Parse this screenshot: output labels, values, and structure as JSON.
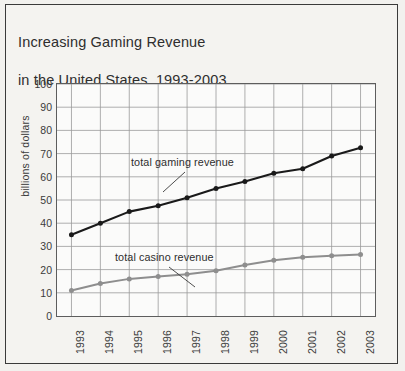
{
  "figure": {
    "title_line1": "Increasing Gaming Revenue",
    "title_line2": "in the United States, 1993-2003",
    "background_color": "#f2f1ee",
    "frame_color": "#3a3a3a"
  },
  "chart_data": {
    "type": "line",
    "title": "Increasing Gaming Revenue in the United States, 1993-2003",
    "xlabel": "",
    "ylabel": "billions of dollars",
    "categories": [
      "1993",
      "1994",
      "1995",
      "1996",
      "1997",
      "1998",
      "1999",
      "2000",
      "2001",
      "2002",
      "2003"
    ],
    "ylim": [
      0,
      100
    ],
    "ytick_labels": [
      "0",
      "10",
      "20",
      "30",
      "40",
      "50",
      "60",
      "70",
      "80",
      "90",
      "100"
    ],
    "ytick_values": [
      0,
      10,
      20,
      30,
      40,
      50,
      60,
      70,
      80,
      90,
      100
    ],
    "ytick_step": 10,
    "grid": true,
    "legend_position": "inline-annotation",
    "series": [
      {
        "name": "total gaming revenue",
        "color": "#1a1a1a",
        "marker": "circle",
        "values": [
          35,
          40,
          45,
          47.5,
          51,
          55,
          58,
          61.5,
          63.5,
          69,
          72.5
        ]
      },
      {
        "name": "total casino revenue",
        "color": "#8e8e8e",
        "marker": "circle",
        "values": [
          11,
          14,
          16,
          17,
          18,
          19.5,
          22,
          24,
          25.3,
          26,
          26.5
        ]
      }
    ],
    "annotations": [
      {
        "text": "total gaming revenue",
        "target_category": "1997",
        "target_series": "total gaming revenue"
      },
      {
        "text": "total casino revenue",
        "target_category": "1997",
        "target_series": "total casino revenue"
      }
    ]
  }
}
